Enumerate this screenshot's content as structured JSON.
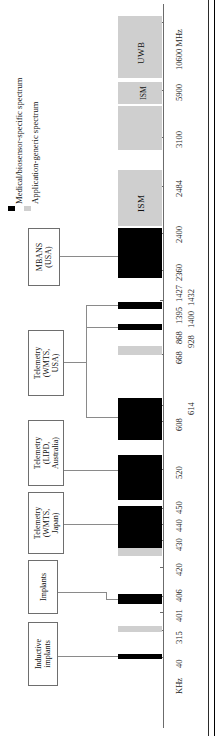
{
  "figure": {
    "type": "spectrum-allocation-diagram",
    "orientation": "rotated-90-ccw",
    "axis_unit_low": "KHz",
    "axis_unit_high": "MHz"
  },
  "legend": {
    "items": [
      {
        "label": "Medical/biosensor-specific spectrum",
        "swatch": "legend-swatch-medical",
        "color": "#000000"
      },
      {
        "label": "Application-generic spectrum",
        "swatch": "legend-swatch-generic",
        "color": "#cfcfcf"
      }
    ]
  },
  "axis": {
    "unit_low_label": "KHz",
    "unit_high_label": "MHz",
    "ticks": [
      {
        "label": "40",
        "y": 657
      },
      {
        "label": "315",
        "y": 630
      },
      {
        "label": "401",
        "y": 612
      },
      {
        "label": "406",
        "y": 596
      },
      {
        "label": "420",
        "y": 567
      },
      {
        "label": "430",
        "y": 540
      },
      {
        "label": "440",
        "y": 524
      },
      {
        "label": "450",
        "y": 508
      },
      {
        "label": "520",
        "y": 469
      },
      {
        "label": "608",
        "y": 421
      },
      {
        "label": "614",
        "y": 405
      },
      {
        "label": "668",
        "y": 354
      },
      {
        "label": "868",
        "y": 338
      },
      {
        "label": "928",
        "y": 338
      },
      {
        "label": "1395",
        "y": 318
      },
      {
        "label": "1400",
        "y": 318
      },
      {
        "label": "1427",
        "y": 300
      },
      {
        "label": "1432",
        "y": 300
      },
      {
        "label": "2360",
        "y": 270
      },
      {
        "label": "2400",
        "y": 233
      },
      {
        "label": "2484",
        "y": 186
      },
      {
        "label": "3100",
        "y": 137
      },
      {
        "label": "5900",
        "y": 90
      },
      {
        "label": "10600 MHz",
        "y": 22
      }
    ]
  },
  "bands": [
    {
      "name": "band-inductive",
      "kind": "medical",
      "label": ""
    },
    {
      "name": "band-315",
      "kind": "generic",
      "label": ""
    },
    {
      "name": "band-meds-401-406",
      "kind": "medical",
      "label": ""
    },
    {
      "name": "band-420-450",
      "kind": "medical",
      "label": ""
    },
    {
      "name": "band-430-440",
      "kind": "generic",
      "label": ""
    },
    {
      "name": "band-wmts-520",
      "kind": "medical",
      "label": ""
    },
    {
      "name": "band-wmts-608-614",
      "kind": "medical",
      "label": ""
    },
    {
      "name": "band-868-928",
      "kind": "generic",
      "label": ""
    },
    {
      "name": "band-1395-1400",
      "kind": "medical",
      "label": ""
    },
    {
      "name": "band-1427-1432",
      "kind": "medical",
      "label": ""
    },
    {
      "name": "band-mbans-2360",
      "kind": "medical",
      "label": ""
    },
    {
      "name": "band-ism-2400",
      "kind": "generic",
      "label": "ISM"
    },
    {
      "name": "band-3100",
      "kind": "generic",
      "label": ""
    },
    {
      "name": "band-ism-5900",
      "kind": "generic",
      "label": "ISM"
    },
    {
      "name": "band-uwb",
      "kind": "generic",
      "label": "UWB"
    }
  ],
  "callouts": [
    {
      "name": "callout-inductive-implants",
      "text": "Inductive\nimplants"
    },
    {
      "name": "callout-implants",
      "text": "Implants"
    },
    {
      "name": "callout-telemetry-wmts-japan",
      "text": "Telemetry\n(WMTS,\nJapan)"
    },
    {
      "name": "callout-telemetry-lipd-australia",
      "text": "Telemetry\n(LIPD,\nAustralia)"
    },
    {
      "name": "callout-telemetry-wmts-usa",
      "text": "Telemetry\n(WMTS,\nUSA)"
    },
    {
      "name": "callout-mbans-usa",
      "text": "MBANS\n(USA)"
    }
  ]
}
